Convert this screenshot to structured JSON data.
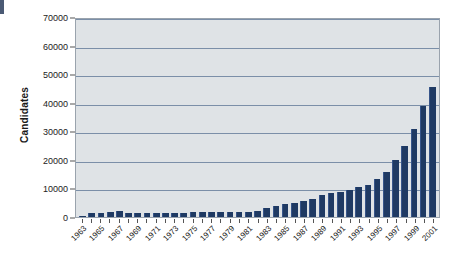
{
  "chart_data": {
    "type": "bar",
    "title": "",
    "xlabel": "",
    "ylabel": "Candidates",
    "ylim": [
      0,
      70000
    ],
    "yticks": [
      0,
      10000,
      20000,
      30000,
      40000,
      50000,
      60000,
      70000
    ],
    "ytick_labels": [
      "0",
      "10000",
      "20000",
      "30000",
      "40000",
      "50000",
      "60000",
      "70000"
    ],
    "grid": true,
    "legend": false,
    "bar_color": "#1f3a63",
    "plot_background": "#dfe3e6",
    "xtick_label_rotation": -45,
    "xtick_label_interval": 2,
    "categories": [
      "1963",
      "1964",
      "1965",
      "1966",
      "1967",
      "1968",
      "1969",
      "1970",
      "1971",
      "1972",
      "1973",
      "1974",
      "1975",
      "1976",
      "1977",
      "1978",
      "1979",
      "1980",
      "1981",
      "1982",
      "1983",
      "1984",
      "1985",
      "1986",
      "1987",
      "1988",
      "1989",
      "1990",
      "1991",
      "1992",
      "1993",
      "1994",
      "1995",
      "1996",
      "1997",
      "1998",
      "1999",
      "2000",
      "2001"
    ],
    "values": [
      500,
      1400,
      1500,
      1800,
      2100,
      1500,
      1400,
      1300,
      1300,
      1300,
      1400,
      1500,
      1700,
      1800,
      1900,
      1900,
      1800,
      1800,
      1800,
      2300,
      3100,
      4000,
      4700,
      5000,
      5500,
      6300,
      7900,
      8400,
      9000,
      9600,
      10700,
      11200,
      13300,
      16000,
      20000,
      25200,
      31200,
      39400,
      45800
    ],
    "extra_values_note": "",
    "series_name": "Candidates"
  },
  "axis": {
    "y_title": "Candidates"
  }
}
